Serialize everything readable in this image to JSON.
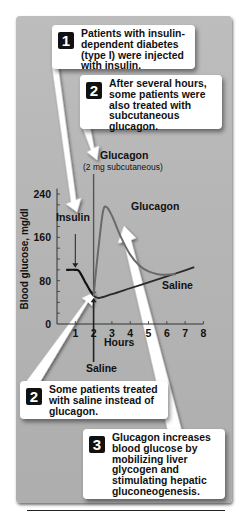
{
  "callouts": [
    {
      "number": "1",
      "text": "Patients with insulin-dependent diabetes (type I) were injected with insulin."
    },
    {
      "number": "2",
      "text": "After several hours, some patients were also treated with subcutaneous glucagon."
    },
    {
      "number": "2",
      "text": "Some patients treated with saline instead of glucagon."
    },
    {
      "number": "3",
      "text": "Glucagon increases blood glucose by mobilizing liver glycogen and stimulating hepatic gluconeogenesis."
    }
  ],
  "annotations": {
    "glucagon_injection": "Glucagon",
    "glucagon_dose": "(2 mg subcutaneous)",
    "insulin": "Insulin",
    "saline_injection": "Saline"
  },
  "colors": {
    "panel": "#b8b8b8",
    "insulin_curve": "#111111",
    "saline_curve": "#2a2a2a",
    "glucagon_curve": "#6a6a6a"
  },
  "chart_data": {
    "type": "line",
    "title": "",
    "xlabel": "Hours",
    "ylabel": "Blood glucose, mg/dl",
    "xlim": [
      0,
      8
    ],
    "ylim": [
      0,
      240
    ],
    "xticks": [
      "1",
      "2",
      "3",
      "4",
      "5",
      "6",
      "7",
      "8"
    ],
    "yticks": [
      "0",
      "80",
      "160",
      "240"
    ],
    "grid": false,
    "series": [
      {
        "name": "Insulin",
        "x": [
          0.5,
          1.0,
          1.2,
          1.5,
          1.8,
          2.0
        ],
        "y": [
          100,
          100,
          98,
          80,
          62,
          52
        ]
      },
      {
        "name": "Saline",
        "x": [
          2.0,
          2.3,
          3.0,
          4.0,
          5.0,
          6.0,
          7.0,
          7.5
        ],
        "y": [
          52,
          48,
          55,
          66,
          77,
          88,
          99,
          105
        ]
      },
      {
        "name": "Glucagon",
        "x": [
          2.0,
          2.2,
          2.5,
          2.7,
          3.0,
          3.5,
          4.0,
          4.5,
          5.0,
          5.5,
          6.0,
          6.5
        ],
        "y": [
          52,
          120,
          205,
          216,
          200,
          160,
          128,
          108,
          97,
          92,
          91,
          92
        ]
      }
    ],
    "legend": "inline labels",
    "events": [
      {
        "label": "Glucagon (2 mg subcutaneous)",
        "x": 2
      },
      {
        "label": "Insulin",
        "x": 1
      },
      {
        "label": "Saline",
        "x": 2
      }
    ]
  }
}
